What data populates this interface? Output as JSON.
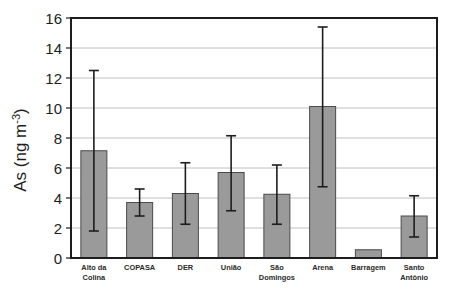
{
  "chart_data": {
    "type": "bar",
    "title": "",
    "xlabel": "",
    "ylabel": "As (ng m",
    "ylabel_sup": "-3",
    "ylabel_close": ")",
    "ylim": [
      0,
      16
    ],
    "yticks": [
      0,
      2,
      4,
      6,
      8,
      10,
      12,
      14,
      16
    ],
    "ytick_labels": [
      "0",
      "2",
      "4",
      "6",
      "8",
      "10",
      "12",
      "14",
      "16"
    ],
    "grid": true,
    "legend": "none",
    "error_bars": true,
    "categories": [
      "Alto da Colina",
      "COPASA",
      "DER",
      "União",
      "São Domingos",
      "Arena",
      "Barragem",
      "Santo Antônio"
    ],
    "category_label_lines": [
      [
        "Alto da",
        "Colina"
      ],
      [
        "COPASA"
      ],
      [
        "DER"
      ],
      [
        "União"
      ],
      [
        "São",
        "Domingos"
      ],
      [
        "Arena"
      ],
      [
        "Barragem"
      ],
      [
        "Santo",
        "Antônio"
      ]
    ],
    "values": [
      7.15,
      3.7,
      4.3,
      5.7,
      4.25,
      10.1,
      0.55,
      2.8
    ],
    "err_low": [
      1.8,
      2.8,
      2.25,
      3.15,
      2.25,
      4.75,
      null,
      1.4
    ],
    "err_high": [
      12.5,
      4.6,
      6.35,
      8.15,
      6.2,
      15.4,
      null,
      4.15
    ],
    "bar_color": "#9a9a9a",
    "bar_edge_color": "#4a4a4a",
    "error_bar_color": "#1d1d1d",
    "grid_color": "#b9b9b9",
    "axis_color": "#1d1d1d"
  }
}
